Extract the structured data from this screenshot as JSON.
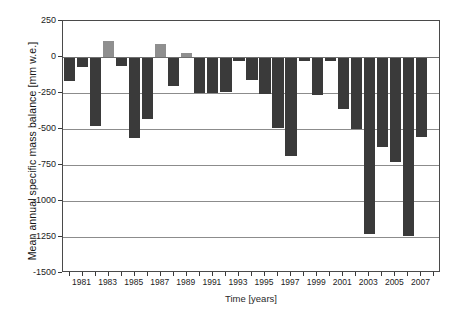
{
  "chart_data": {
    "type": "bar",
    "title": "",
    "xlabel": "Time [years]",
    "ylabel": "Mean annual specific mass balance [mm w.e.]",
    "ylim": [
      -1500,
      250
    ],
    "yticks": [
      250,
      0,
      -250,
      -500,
      -750,
      -1000,
      -1250,
      -1500
    ],
    "ytick_labels": [
      "250",
      "0",
      "-250",
      "-500",
      "-750",
      "-1000",
      "-1250",
      "-1500"
    ],
    "xlim": [
      1979.5,
      2008.5
    ],
    "xticks": [
      1980,
      1981,
      1982,
      1983,
      1984,
      1985,
      1986,
      1987,
      1988,
      1989,
      1990,
      1991,
      1992,
      1993,
      1994,
      1995,
      1996,
      1997,
      1998,
      1999,
      2000,
      2001,
      2002,
      2003,
      2004,
      2005,
      2006,
      2007,
      2008
    ],
    "xtick_labels": [
      "1981",
      "1983",
      "1985",
      "1987",
      "1989",
      "1991",
      "1993",
      "1995",
      "1997",
      "1999",
      "2001",
      "2003",
      "2005",
      "2007"
    ],
    "xtick_label_years": [
      1981,
      1983,
      1985,
      1987,
      1989,
      1991,
      1993,
      1995,
      1997,
      1999,
      2001,
      2003,
      2005,
      2007
    ],
    "grid": true,
    "grid_axis": "y",
    "legend": "none",
    "colors": {
      "negative_bar": "#3a3a3a",
      "positive_bar": "#8f8f8f",
      "axis": "#4a4a4a",
      "gridline": "#8c8c8c",
      "background": "#ffffff"
    },
    "categories": [
      1980,
      1981,
      1982,
      1983,
      1984,
      1985,
      1986,
      1987,
      1988,
      1989,
      1990,
      1991,
      1992,
      1993,
      1994,
      1995,
      1996,
      1997,
      1998,
      1999,
      2000,
      2001,
      2002,
      2003,
      2004,
      2005,
      2006,
      2007
    ],
    "values": [
      -165,
      -70,
      -480,
      110,
      -60,
      -565,
      -430,
      90,
      -200,
      30,
      -250,
      -250,
      -245,
      -30,
      -160,
      -255,
      -495,
      -690,
      -30,
      -265,
      -25,
      -360,
      -500,
      -1230,
      -625,
      -730,
      -1245,
      -555
    ]
  }
}
